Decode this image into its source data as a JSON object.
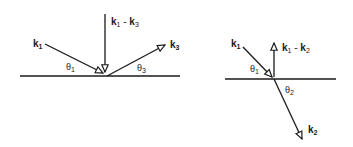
{
  "diagrams": [
    {
      "id": "reflection",
      "vectors": [
        {
          "name": "k",
          "sub": "1",
          "role": "incident"
        },
        {
          "name": "k",
          "sub": "1",
          "op": " - ",
          "name2": "k",
          "sub2": "3",
          "role": "momentum-transfer"
        },
        {
          "name": "k",
          "sub": "3",
          "role": "reflected"
        }
      ],
      "angles": [
        {
          "symbol": "θ",
          "sub": "1"
        },
        {
          "symbol": "θ",
          "sub": "3"
        }
      ]
    },
    {
      "id": "refraction",
      "vectors": [
        {
          "name": "k",
          "sub": "1",
          "role": "incident"
        },
        {
          "name": "k",
          "sub": "1",
          "op": " - ",
          "name2": "k",
          "sub2": "2",
          "role": "momentum-transfer"
        },
        {
          "name": "k",
          "sub": "2",
          "role": "refracted"
        }
      ],
      "angles": [
        {
          "symbol": "θ",
          "sub": "1"
        },
        {
          "symbol": "θ",
          "sub": "2"
        }
      ]
    }
  ],
  "colors": {
    "line": "#1a1a1a",
    "background": "#ffffff"
  }
}
